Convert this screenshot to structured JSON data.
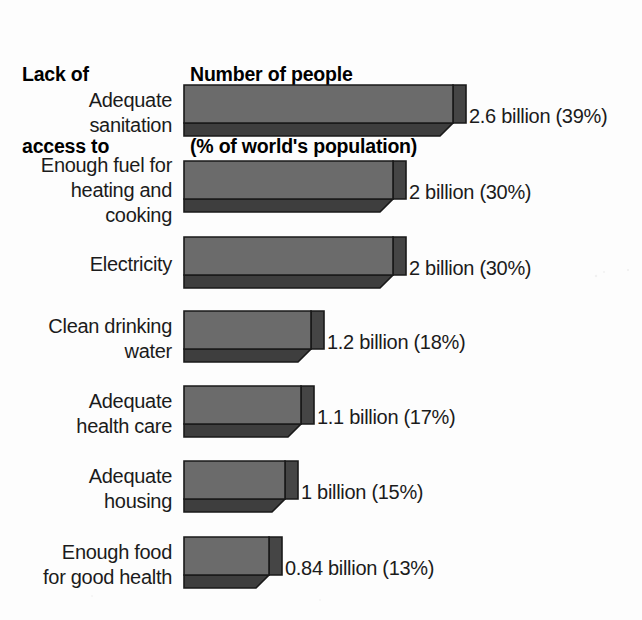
{
  "header": {
    "category_heading_lines": [
      "Lack of",
      "access to"
    ],
    "value_heading_lines": [
      "Number of people",
      "(% of world's population)"
    ]
  },
  "colors": {
    "background": "#fdfdfd",
    "bar_top_face": "#6b6b6b",
    "bar_front_face": "#3e3e3e",
    "bar_side_face": "#454545",
    "bar_outline": "#1a1a1a",
    "text": "#1b1b1b",
    "heading_text": "#000000"
  },
  "chart_data": {
    "type": "bar",
    "orientation": "horizontal",
    "style": "3d-isometric-bar",
    "title": "",
    "subtitle": "",
    "xlabel": "",
    "ylabel": "",
    "category_axis_title_lines": [
      "Lack of",
      "access to"
    ],
    "value_axis_title_lines": [
      "Number of people",
      "(% of world's population)"
    ],
    "grid": false,
    "legend": false,
    "units": "billions of people",
    "secondary_units": "% of world's population",
    "xlim": [
      0,
      2.6
    ],
    "categories": [
      "Adequate sanitation",
      "Enough fuel for heating and cooking",
      "Electricity",
      "Clean drinking water",
      "Adequate health care",
      "Adequate housing",
      "Enough food for good health"
    ],
    "values": [
      2.6,
      2,
      2,
      1.2,
      1.1,
      1,
      0.84
    ],
    "percentages": [
      39,
      30,
      30,
      18,
      17,
      15,
      13
    ],
    "data_labels": [
      "2.6 billion (39%)",
      "2 billion (30%)",
      "2 billion (30%)",
      "1.2 billion (18%)",
      "1.1 billion (17%)",
      "1 billion (15%)",
      "0.84 billion (13%)"
    ]
  },
  "rows": [
    {
      "label_lines": [
        "Adequate",
        "sanitation"
      ],
      "data_label": "2.6 billion (39%)",
      "value": 2.6,
      "percent": 39,
      "bar_top": 84,
      "bar_width": 269,
      "label_top": 88,
      "value_left": 469,
      "value_top": 104
    },
    {
      "label_lines": [
        "Enough fuel for",
        "heating and",
        "cooking"
      ],
      "data_label": "2 billion (30%)",
      "value": 2,
      "percent": 30,
      "bar_top": 160,
      "bar_width": 209,
      "label_top": 153,
      "value_left": 409,
      "value_top": 180
    },
    {
      "label_lines": [
        "Electricity"
      ],
      "data_label": "2 billion (30%)",
      "value": 2,
      "percent": 30,
      "bar_top": 236,
      "bar_width": 209,
      "label_top": 252,
      "value_left": 409,
      "value_top": 256
    },
    {
      "label_lines": [
        "Clean drinking",
        "water"
      ],
      "data_label": "1.2 billion (18%)",
      "value": 1.2,
      "percent": 18,
      "bar_top": 310,
      "bar_width": 127,
      "label_top": 314,
      "value_left": 327,
      "value_top": 330
    },
    {
      "label_lines": [
        "Adequate",
        "health care"
      ],
      "data_label": "1.1 billion (17%)",
      "value": 1.1,
      "percent": 17,
      "bar_top": 385,
      "bar_width": 117,
      "label_top": 389,
      "value_left": 317,
      "value_top": 405
    },
    {
      "label_lines": [
        "Adequate",
        "housing"
      ],
      "data_label": "1 billion (15%)",
      "value": 1,
      "percent": 15,
      "bar_top": 460,
      "bar_width": 101,
      "label_top": 464,
      "value_left": 301,
      "value_top": 480
    },
    {
      "label_lines": [
        "Enough food",
        "for good health"
      ],
      "data_label": "0.84 billion (13%)",
      "value": 0.84,
      "percent": 13,
      "bar_top": 536,
      "bar_width": 85,
      "label_top": 540,
      "value_left": 285,
      "value_top": 556
    }
  ]
}
